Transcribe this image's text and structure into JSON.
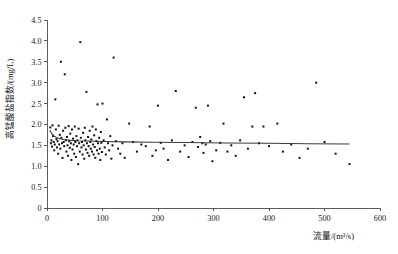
{
  "chart_data": {
    "type": "scatter",
    "title": "",
    "xlabel": "流量/(m³/s)",
    "ylabel": "高锰酸盐指数/(mg/L)",
    "xlim": [
      0,
      600
    ],
    "ylim": [
      0,
      4.5
    ],
    "xticks": [
      0,
      100,
      200,
      300,
      400,
      500,
      600
    ],
    "yticks": [
      0,
      0.5,
      1.0,
      1.5,
      2.0,
      2.5,
      3.0,
      3.5,
      4.0,
      4.5
    ],
    "xtick_labels": [
      "0",
      "100",
      "200",
      "300",
      "400",
      "500",
      "600"
    ],
    "ytick_labels": [
      "0",
      "0.5",
      "1.0",
      "1.5",
      "2.0",
      "2.5",
      "3.0",
      "3.5",
      "4.0",
      "4.5"
    ],
    "grid": false,
    "legend": null,
    "marker": "filled-square",
    "marker_color": "#111111",
    "series": [
      {
        "name": "高锰酸盐指数",
        "points": [
          [
            6,
            1.93
          ],
          [
            7,
            1.55
          ],
          [
            8,
            1.62
          ],
          [
            9,
            1.47
          ],
          [
            10,
            1.98
          ],
          [
            11,
            1.72
          ],
          [
            12,
            1.58
          ],
          [
            13,
            1.38
          ],
          [
            14,
            1.52
          ],
          [
            15,
            2.6
          ],
          [
            16,
            1.88
          ],
          [
            17,
            1.65
          ],
          [
            18,
            1.45
          ],
          [
            19,
            1.6
          ],
          [
            20,
            1.3
          ],
          [
            21,
            1.97
          ],
          [
            22,
            1.52
          ],
          [
            23,
            1.75
          ],
          [
            24,
            1.42
          ],
          [
            25,
            3.5
          ],
          [
            26,
            1.68
          ],
          [
            27,
            1.55
          ],
          [
            28,
            1.2
          ],
          [
            29,
            1.85
          ],
          [
            30,
            1.58
          ],
          [
            31,
            1.48
          ],
          [
            32,
            3.2
          ],
          [
            33,
            1.92
          ],
          [
            34,
            1.62
          ],
          [
            35,
            1.35
          ],
          [
            36,
            1.7
          ],
          [
            37,
            1.5
          ],
          [
            38,
            1.25
          ],
          [
            39,
            1.96
          ],
          [
            40,
            1.6
          ],
          [
            41,
            1.44
          ],
          [
            42,
            1.78
          ],
          [
            43,
            1.55
          ],
          [
            44,
            1.15
          ],
          [
            45,
            1.88
          ],
          [
            46,
            1.4
          ],
          [
            47,
            1.66
          ],
          [
            48,
            1.52
          ],
          [
            49,
            1.3
          ],
          [
            50,
            1.95
          ],
          [
            51,
            1.58
          ],
          [
            52,
            1.22
          ],
          [
            53,
            1.72
          ],
          [
            54,
            1.48
          ],
          [
            55,
            1.62
          ],
          [
            56,
            1.05
          ],
          [
            57,
            1.9
          ],
          [
            58,
            1.55
          ],
          [
            59,
            1.35
          ],
          [
            60,
            3.97
          ],
          [
            61,
            1.68
          ],
          [
            62,
            1.45
          ],
          [
            63,
            1.58
          ],
          [
            64,
            1.28
          ],
          [
            65,
            1.8
          ],
          [
            66,
            1.5
          ],
          [
            67,
            1.18
          ],
          [
            68,
            1.92
          ],
          [
            69,
            1.62
          ],
          [
            70,
            1.4
          ],
          [
            71,
            2.78
          ],
          [
            72,
            1.55
          ],
          [
            73,
            1.32
          ],
          [
            74,
            1.7
          ],
          [
            75,
            1.48
          ],
          [
            76,
            1.25
          ],
          [
            77,
            1.85
          ],
          [
            78,
            1.58
          ],
          [
            79,
            1.42
          ],
          [
            80,
            1.64
          ],
          [
            81,
            1.35
          ],
          [
            82,
            1.95
          ],
          [
            83,
            1.52
          ],
          [
            84,
            1.28
          ],
          [
            85,
            1.74
          ],
          [
            86,
            1.46
          ],
          [
            87,
            1.2
          ],
          [
            88,
            1.88
          ],
          [
            89,
            1.6
          ],
          [
            90,
            1.38
          ],
          [
            91,
            2.48
          ],
          [
            92,
            1.55
          ],
          [
            93,
            1.3
          ],
          [
            94,
            1.68
          ],
          [
            95,
            1.42
          ],
          [
            96,
            1.15
          ],
          [
            97,
            1.82
          ],
          [
            98,
            1.56
          ],
          [
            99,
            1.34
          ],
          [
            100,
            2.5
          ],
          [
            102,
            1.62
          ],
          [
            104,
            1.45
          ],
          [
            106,
            1.28
          ],
          [
            108,
            2.12
          ],
          [
            110,
            1.55
          ],
          [
            112,
            1.38
          ],
          [
            114,
            1.72
          ],
          [
            116,
            1.18
          ],
          [
            118,
            1.5
          ],
          [
            120,
            3.6
          ],
          [
            124,
            1.6
          ],
          [
            128,
            1.42
          ],
          [
            132,
            1.3
          ],
          [
            136,
            1.55
          ],
          [
            140,
            1.2
          ],
          [
            148,
            2.02
          ],
          [
            155,
            1.58
          ],
          [
            162,
            1.35
          ],
          [
            170,
            1.52
          ],
          [
            178,
            1.48
          ],
          [
            185,
            1.95
          ],
          [
            190,
            1.25
          ],
          [
            196,
            1.38
          ],
          [
            200,
            2.45
          ],
          [
            205,
            1.56
          ],
          [
            210,
            1.42
          ],
          [
            218,
            1.15
          ],
          [
            225,
            1.62
          ],
          [
            232,
            2.8
          ],
          [
            240,
            1.35
          ],
          [
            248,
            1.5
          ],
          [
            255,
            1.22
          ],
          [
            262,
            1.58
          ],
          [
            268,
            2.4
          ],
          [
            272,
            1.46
          ],
          [
            276,
            1.7
          ],
          [
            280,
            1.55
          ],
          [
            282,
            1.32
          ],
          [
            286,
            1.52
          ],
          [
            290,
            2.45
          ],
          [
            294,
            1.6
          ],
          [
            298,
            1.12
          ],
          [
            305,
            1.38
          ],
          [
            312,
            1.56
          ],
          [
            318,
            2.02
          ],
          [
            325,
            1.35
          ],
          [
            332,
            1.5
          ],
          [
            340,
            1.25
          ],
          [
            348,
            1.62
          ],
          [
            355,
            2.65
          ],
          [
            362,
            1.42
          ],
          [
            370,
            1.95
          ],
          [
            375,
            2.75
          ],
          [
            382,
            1.55
          ],
          [
            390,
            1.95
          ],
          [
            400,
            1.48
          ],
          [
            415,
            2.02
          ],
          [
            425,
            1.35
          ],
          [
            440,
            1.52
          ],
          [
            455,
            1.2
          ],
          [
            470,
            1.42
          ],
          [
            485,
            3.0
          ],
          [
            500,
            1.58
          ],
          [
            520,
            1.3
          ],
          [
            545,
            1.05
          ]
        ]
      }
    ],
    "trendline": {
      "description": "fitted regression curve, steep initial decline then near-flat",
      "points": [
        [
          5,
          1.86
        ],
        [
          8,
          1.79
        ],
        [
          12,
          1.73
        ],
        [
          17,
          1.69
        ],
        [
          23,
          1.66
        ],
        [
          30,
          1.64
        ],
        [
          40,
          1.625
        ],
        [
          55,
          1.612
        ],
        [
          75,
          1.602
        ],
        [
          100,
          1.593
        ],
        [
          140,
          1.583
        ],
        [
          190,
          1.574
        ],
        [
          250,
          1.566
        ],
        [
          320,
          1.557
        ],
        [
          400,
          1.548
        ],
        [
          470,
          1.54
        ],
        [
          545,
          1.532
        ]
      ]
    }
  },
  "geometry": {
    "plot_left": 47,
    "plot_right": 380,
    "plot_top": 20,
    "plot_bottom": 208
  }
}
